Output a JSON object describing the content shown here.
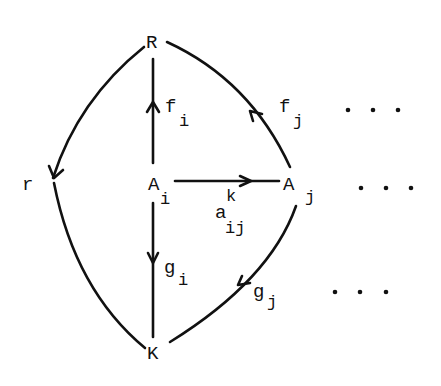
{
  "diagram": {
    "type": "commutative-diagram",
    "nodes": {
      "R": {
        "label": "R"
      },
      "r": {
        "label": "r"
      },
      "Ai": {
        "label": "A",
        "sub": "i"
      },
      "Aj": {
        "label": "A",
        "sub": "j"
      },
      "K": {
        "label": "K"
      }
    },
    "edges": {
      "fi": {
        "from": "Ai",
        "to": "R",
        "label": "f",
        "sub": "i"
      },
      "fj": {
        "from": "Aj",
        "to": "R",
        "label": "f",
        "sub": "j"
      },
      "gi": {
        "from": "Ai",
        "to": "K",
        "label": "g",
        "sub": "i"
      },
      "gj": {
        "from": "Aj",
        "to": "K",
        "label": "g",
        "sub": "j"
      },
      "aij": {
        "from": "Ai",
        "to": "Aj",
        "label": "a",
        "sup": "k",
        "sub": "ij"
      },
      "Rr": {
        "from": "R",
        "to": "r"
      },
      "Kr": {
        "from": "K",
        "to": "r"
      }
    },
    "ellipses": {
      "top": "...",
      "middle": "...",
      "bottom": "..."
    }
  }
}
